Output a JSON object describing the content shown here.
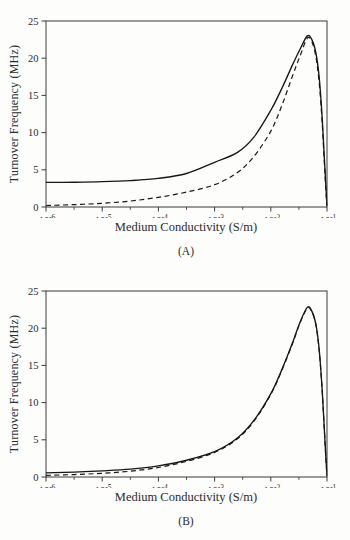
{
  "page": {
    "background": "#fdfdfb",
    "ink_color": "#2b2b2b",
    "axis_color": "#3a3a3a",
    "curve_color": "#161616"
  },
  "chart_data": [
    {
      "type": "line",
      "caption": "(A)",
      "xlabel": "Medium Conductivity (S/m)",
      "ylabel": "Turnover Frequency (MHz)",
      "x_scale": "log",
      "xlim_exponents": [
        -6,
        -1
      ],
      "x_tick_exponents": [
        -6,
        -5,
        -4,
        -3,
        -2,
        -1
      ],
      "x_minor_tick_exponents": [
        -5.5,
        -4.5,
        -3.5,
        -2.5,
        -1.5
      ],
      "y_ticks": [
        0,
        5,
        10,
        15,
        20,
        25
      ],
      "ylim": [
        0,
        25
      ],
      "grid": false,
      "legend": "none",
      "series": [
        {
          "name": "dashed-curve",
          "style": "dashed",
          "points_logx_mhz": [
            [
              -6,
              0.2
            ],
            [
              -5.5,
              0.32
            ],
            [
              -5,
              0.5
            ],
            [
              -4.5,
              0.8
            ],
            [
              -4,
              1.3
            ],
            [
              -3.5,
              2.0
            ],
            [
              -3,
              3.0
            ],
            [
              -2.6,
              4.6
            ],
            [
              -2.3,
              6.8
            ],
            [
              -2,
              10.2
            ],
            [
              -1.8,
              13.7
            ],
            [
              -1.62,
              17.5
            ],
            [
              -1.48,
              20.3
            ],
            [
              -1.35,
              22.7
            ],
            [
              -1.27,
              22.2
            ],
            [
              -1.2,
              20.3
            ],
            [
              -1.14,
              16.8
            ],
            [
              -1.09,
              11.8
            ],
            [
              -1.05,
              6.3
            ],
            [
              -1.02,
              2.2
            ],
            [
              -1.0,
              0.1
            ]
          ]
        },
        {
          "name": "solid-curve",
          "style": "solid",
          "points_logx_mhz": [
            [
              -6,
              3.3
            ],
            [
              -5.5,
              3.33
            ],
            [
              -5,
              3.4
            ],
            [
              -4.5,
              3.55
            ],
            [
              -4,
              3.85
            ],
            [
              -3.5,
              4.5
            ],
            [
              -3,
              6.0
            ],
            [
              -2.6,
              7.3
            ],
            [
              -2.3,
              9.4
            ],
            [
              -2,
              13.0
            ],
            [
              -1.8,
              16.0
            ],
            [
              -1.62,
              19.0
            ],
            [
              -1.48,
              21.2
            ],
            [
              -1.35,
              23.0
            ],
            [
              -1.27,
              22.5
            ],
            [
              -1.2,
              20.8
            ],
            [
              -1.14,
              17.5
            ],
            [
              -1.09,
              12.5
            ],
            [
              -1.05,
              7.0
            ],
            [
              -1.02,
              2.8
            ],
            [
              -1.0,
              0.2
            ]
          ]
        }
      ]
    },
    {
      "type": "line",
      "caption": "(B)",
      "xlabel": "Medium Conductivity (S/m)",
      "ylabel": "Turnover Frequency (MHz)",
      "x_scale": "log",
      "xlim_exponents": [
        -6,
        -1
      ],
      "x_tick_exponents": [
        -6,
        -5,
        -4,
        -3,
        -2,
        -1
      ],
      "x_minor_tick_exponents": [
        -5.5,
        -4.5,
        -3.5,
        -2.5,
        -1.5
      ],
      "y_ticks": [
        0,
        5,
        10,
        15,
        20,
        25
      ],
      "ylim": [
        0,
        25
      ],
      "grid": false,
      "legend": "none",
      "series": [
        {
          "name": "dashed-curve",
          "style": "dashed",
          "points_logx_mhz": [
            [
              -6,
              0.22
            ],
            [
              -5.5,
              0.33
            ],
            [
              -5,
              0.5
            ],
            [
              -4.5,
              0.78
            ],
            [
              -4,
              1.28
            ],
            [
              -3.5,
              2.1
            ],
            [
              -3,
              3.3
            ],
            [
              -2.6,
              5.1
            ],
            [
              -2.3,
              7.5
            ],
            [
              -2,
              11.1
            ],
            [
              -1.8,
              14.4
            ],
            [
              -1.62,
              17.8
            ],
            [
              -1.48,
              20.7
            ],
            [
              -1.35,
              22.7
            ],
            [
              -1.27,
              22.2
            ],
            [
              -1.2,
              20.5
            ],
            [
              -1.14,
              17.1
            ],
            [
              -1.09,
              12.1
            ],
            [
              -1.05,
              6.7
            ],
            [
              -1.02,
              2.5
            ],
            [
              -1.0,
              0.1
            ]
          ]
        },
        {
          "name": "solid-curve",
          "style": "solid",
          "points_logx_mhz": [
            [
              -6,
              0.55
            ],
            [
              -5.5,
              0.66
            ],
            [
              -5,
              0.82
            ],
            [
              -4.5,
              1.05
            ],
            [
              -4,
              1.5
            ],
            [
              -3.5,
              2.25
            ],
            [
              -3,
              3.4
            ],
            [
              -2.6,
              5.2
            ],
            [
              -2.3,
              7.6
            ],
            [
              -2,
              11.2
            ],
            [
              -1.8,
              14.5
            ],
            [
              -1.62,
              17.9
            ],
            [
              -1.48,
              20.8
            ],
            [
              -1.35,
              22.8
            ],
            [
              -1.27,
              22.3
            ],
            [
              -1.2,
              20.6
            ],
            [
              -1.14,
              17.2
            ],
            [
              -1.09,
              12.2
            ],
            [
              -1.05,
              6.8
            ],
            [
              -1.02,
              2.6
            ],
            [
              -1.0,
              0.2
            ]
          ]
        }
      ]
    }
  ]
}
